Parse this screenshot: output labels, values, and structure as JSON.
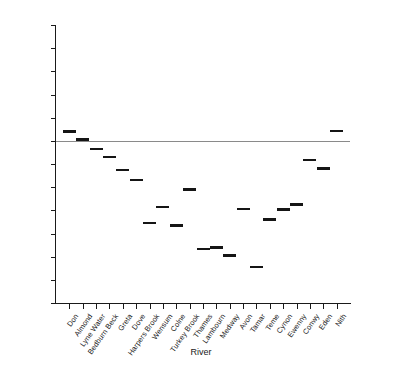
{
  "chart_data": {
    "type": "scatter",
    "title": "",
    "xlabel": "River",
    "ylabel": "% difference",
    "ylim": [
      -70,
      50
    ],
    "yticks": [
      50,
      40,
      30,
      20,
      10,
      0,
      -10,
      -20,
      -30,
      -40,
      -50,
      -60,
      -70
    ],
    "ytick_labels": [
      "50",
      "40",
      "30",
      "20",
      "10",
      "0",
      "-10",
      "-20",
      "-30",
      "-40",
      "-50",
      "-60",
      "-70"
    ],
    "grid": false,
    "legend": null,
    "marker_style": "horizontal-dash",
    "reference_line": 0,
    "categories": [
      "Don",
      "Almond",
      "Lyne Water",
      "Bedburn Beck",
      "Greta",
      "Dove",
      "Harpers Brook",
      "Wensum",
      "Colne",
      "Turkey Brook",
      "Thames",
      "Lambourn",
      "Medway",
      "Avon",
      "Tamar",
      "Teme",
      "Cynon",
      "Ewenny",
      "Conwy",
      "Eden",
      "Nith"
    ],
    "values": [
      4.0,
      0.5,
      -3.5,
      -7.0,
      -12.5,
      -17.0,
      -35.5,
      -28.5,
      -36.5,
      -21.0,
      -46.8,
      -46.0,
      -49.5,
      -29.3,
      -54.5,
      -34.0,
      -29.6,
      -27.5,
      -8.3,
      -12.0,
      4.2
    ]
  },
  "colors": {
    "marker": "#151515",
    "axis": "#1a1a1a",
    "zero_line": "#8a8a8a",
    "background": "#ffffff"
  }
}
